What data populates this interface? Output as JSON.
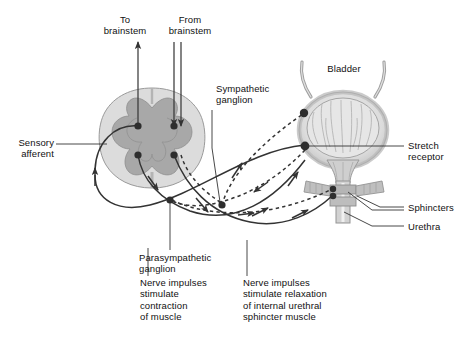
{
  "figure": {
    "type": "anatomical-diagram",
    "background_color": "#ffffff",
    "line_color": "#333333",
    "text_color": "#111111"
  },
  "labels": {
    "to_brainstem": "To\nbrainstem",
    "from_brainstem": "From\nbrainstem",
    "sympathetic_ganglion": "Sympathetic\nganglion",
    "parasympathetic_ganglion": "Parasympathetic\nganglion",
    "sensory_afferent": "Sensory\nafferent",
    "bladder": "Bladder",
    "stretch_receptor": "Stretch\nreceptor",
    "sphincters": "Sphincters",
    "urethra": "Urethra",
    "contraction_note": "Nerve impulses\nstimulate\ncontraction\nof muscle",
    "relaxation_note": "Nerve impulses\nstimulate relaxation\nof internal urethral\nsphincter muscle"
  },
  "structures": {
    "spinal_cord": {
      "name": "spinal cord cross-section",
      "white_matter_color": "#dcdcdc",
      "gray_matter_color": "#a8a8a8",
      "synapse_dots": 4
    },
    "bladder_organ": {
      "name": "urinary bladder",
      "wall_color": "#c9c9c9",
      "lumen_color": "#e4e4e4",
      "ureters": 2,
      "receptor_dots": 2
    },
    "sphincter_bands": {
      "name": "urethral sphincters",
      "color": "#b5b5b5",
      "count": 2
    }
  },
  "pathways": [
    {
      "name": "sensory-afferent",
      "style": "solid",
      "direction": "bladder-to-cord"
    },
    {
      "name": "parasympathetic-efferent",
      "style": "solid",
      "direction": "cord-to-bladder"
    },
    {
      "name": "sympathetic-efferent",
      "style": "dashed",
      "direction": "cord-to-sphincter"
    },
    {
      "name": "ascending-to-brainstem",
      "style": "solid",
      "direction": "up"
    },
    {
      "name": "descending-from-brainstem",
      "style": "solid",
      "direction": "down"
    }
  ]
}
